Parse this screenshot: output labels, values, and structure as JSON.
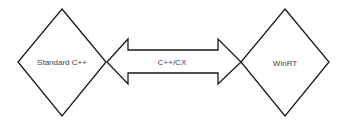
{
  "diagram": {
    "nodes": [
      {
        "id": "left",
        "shape": "diamond",
        "label": "Standard C++"
      },
      {
        "id": "right",
        "shape": "diamond",
        "label": "WinRT"
      }
    ],
    "connector": {
      "shape": "double-headed-arrow",
      "label": "C++/CX",
      "from": "left",
      "to": "right"
    },
    "colors": {
      "stroke": "#1a1a1a",
      "text": "#444444",
      "background": "#ffffff"
    }
  }
}
